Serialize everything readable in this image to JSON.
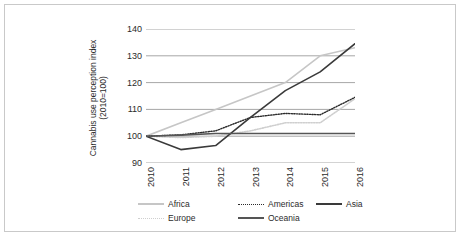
{
  "chart_data": {
    "type": "line",
    "title": "",
    "xlabel": "",
    "ylabel": "Cannabis use perception index (2010=100)",
    "ylabel_line1": "Cannabis use perception index",
    "ylabel_line2": "(2010=100)",
    "x": [
      "2010",
      "2011",
      "2012",
      "2013",
      "2014",
      "2015",
      "2016"
    ],
    "categories": [
      "2010",
      "2011",
      "2012",
      "2013",
      "2014",
      "2015",
      "2016"
    ],
    "ylim": [
      90,
      140
    ],
    "yticks": [
      "140",
      "130",
      "120",
      "110",
      "100",
      "90"
    ],
    "ytick_values": [
      140,
      130,
      120,
      110,
      100,
      90
    ],
    "grid": true,
    "legend_position": "bottom",
    "series": [
      {
        "name": "Africa",
        "values": [
          100,
          105,
          110,
          115,
          120,
          130,
          133
        ],
        "color": "#c6c6c6",
        "style": "solid",
        "width": 1.6
      },
      {
        "name": "Europe",
        "values": [
          100,
          99.5,
          100,
          102,
          105,
          105,
          114
        ],
        "color": "#cfcfcf",
        "style": "dotted",
        "width": 1.6
      },
      {
        "name": "Americas",
        "values": [
          100,
          100.5,
          102,
          107,
          108.5,
          108,
          114.5
        ],
        "color": "#2b2b2b",
        "style": "dotted",
        "width": 1.4
      },
      {
        "name": "Asia",
        "values": [
          100,
          95,
          96.5,
          107,
          117,
          124,
          134.5
        ],
        "color": "#3a3a3a",
        "style": "solid",
        "width": 1.6
      },
      {
        "name": "Oceania",
        "values": [
          100,
          100.4,
          101,
          101,
          101,
          101,
          101
        ],
        "color": "#555555",
        "style": "solid",
        "width": 1.6
      }
    ]
  },
  "legend": {
    "rows": [
      [
        {
          "label": "Africa",
          "series": "Africa"
        },
        {
          "label": "Americas",
          "series": "Americas"
        },
        {
          "label": "Asia",
          "series": "Asia"
        }
      ],
      [
        {
          "label": "Europe",
          "series": "Europe"
        },
        {
          "label": "Oceania",
          "series": "Oceania"
        }
      ]
    ]
  },
  "style": {
    "grid_color": "#8f8f8f",
    "axis_color": "#8f8f8f",
    "frame_color": "#c9c9c9",
    "text_color": "#2b2b2b",
    "background": "#ffffff"
  }
}
